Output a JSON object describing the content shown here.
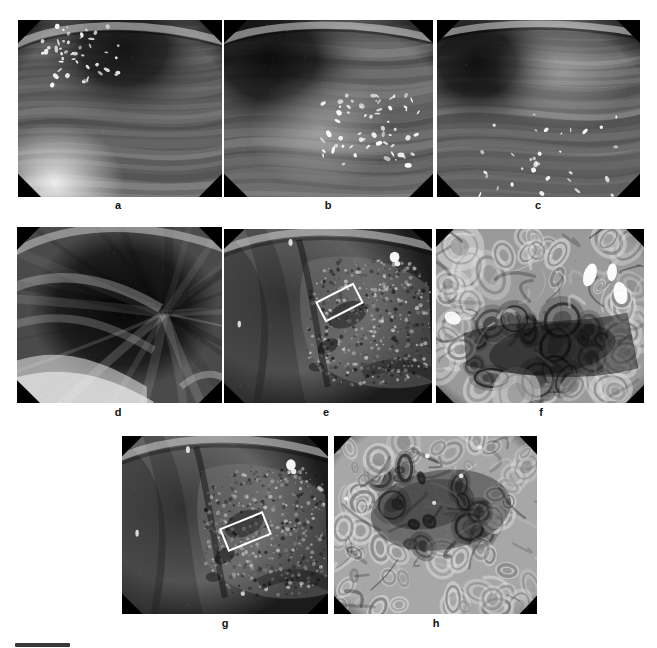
{
  "figure": {
    "type": "multi-panel-endoscopy-figure",
    "background_color": "#ffffff",
    "width": 657,
    "height": 648,
    "panel_count": 8,
    "rows": 3,
    "caption_bar": {
      "present": true,
      "color": "#3a3a3a"
    }
  },
  "panels": [
    {
      "id": "a",
      "label": "a",
      "modality": "white-light endoscopy",
      "description": "Endoscopic view of gastric mucosa with mucus bubbles in upper left; dark lumen at top center; bright reflection along lower left",
      "x": 18,
      "y": 20,
      "w": 204,
      "h": 177,
      "label_x": 103,
      "label_y": 199,
      "frame_color": "#000000",
      "tone": {
        "base": "#6a6a6a",
        "dark": "#141414",
        "bright": "#f2f2f2"
      }
    },
    {
      "id": "b",
      "label": "b",
      "modality": "white-light endoscopy",
      "description": "Gastric mucosa with dark lumen upper left and a cluster of bright specular highlights on right half",
      "x": 224,
      "y": 20,
      "w": 209,
      "h": 177,
      "label_x": 313,
      "label_y": 199,
      "frame_color": "#000000",
      "tone": {
        "base": "#6e6e6e",
        "dark": "#0d0d0d",
        "bright": "#ffffff"
      }
    },
    {
      "id": "c",
      "label": "c",
      "modality": "white-light endoscopy",
      "description": "Gastric mucosa, dark lumen at upper left, fine bright mucus streaks at lower edge and right",
      "x": 437,
      "y": 20,
      "w": 203,
      "h": 177,
      "label_x": 523,
      "label_y": 199,
      "frame_color": "#000000",
      "tone": {
        "base": "#6b6b6b",
        "dark": "#101010",
        "bright": "#fbfbfb"
      }
    },
    {
      "id": "d",
      "label": "d",
      "modality": "white-light endoscopy",
      "description": "Dark retroflexed view of gastric folds radiating from a dark central lumen, bright fold crest along bottom",
      "x": 17,
      "y": 227,
      "w": 205,
      "h": 176,
      "label_x": 103,
      "label_y": 406,
      "frame_color": "#000000",
      "tone": {
        "base": "#4a4a4a",
        "dark": "#0a0a0a",
        "bright": "#ededed"
      }
    },
    {
      "id": "e",
      "label": "e",
      "modality": "chromoendoscopy / indigo carmine",
      "description": "Mucosal lesion with irregular surface on right; white rectangle marks the magnified region",
      "x": 224,
      "y": 229,
      "w": 208,
      "h": 174,
      "label_x": 311,
      "label_y": 406,
      "frame_color": "#000000",
      "tone": {
        "base": "#5f5f5f",
        "dark": "#121212",
        "bright": "#ffffff"
      },
      "annotation": {
        "type": "rectangle",
        "color": "#ffffff",
        "stroke_width": 2,
        "x": 318,
        "y": 291,
        "w": 43,
        "h": 23,
        "rotation_deg": -27
      }
    },
    {
      "id": "f",
      "label": "f",
      "modality": "magnifying endoscopy",
      "description": "High magnification view of gyrus-like / cerebriform pit pattern with bright reflections upper right and left",
      "x": 436,
      "y": 229,
      "w": 208,
      "h": 174,
      "label_x": 526,
      "label_y": 406,
      "frame_color": "#000000",
      "tone": {
        "base": "#9a9a9a",
        "dark": "#1a1a1a",
        "bright": "#ffffff"
      }
    },
    {
      "id": "g",
      "label": "g",
      "modality": "chromoendoscopy / indigo carmine",
      "description": "Same lesion as panel e after staining; white rectangle marks the magnified region shown in panel h",
      "x": 122,
      "y": 436,
      "w": 206,
      "h": 178,
      "label_x": 210,
      "label_y": 617,
      "frame_color": "#000000",
      "tone": {
        "base": "#636363",
        "dark": "#121212",
        "bright": "#ffffff"
      },
      "annotation": {
        "type": "rectangle",
        "color": "#ffffff",
        "stroke_width": 2,
        "x": 222,
        "y": 519,
        "w": 47,
        "h": 25,
        "rotation_deg": -22
      }
    },
    {
      "id": "h",
      "label": "h",
      "modality": "magnifying endoscopy",
      "description": "High magnification view of irregular villous / pit pattern with a darker disrupted central zone",
      "x": 334,
      "y": 436,
      "w": 203,
      "h": 178,
      "label_x": 421,
      "label_y": 617,
      "frame_color": "#000000",
      "tone": {
        "base": "#a7a7a7",
        "dark": "#2a2a2a",
        "bright": "#ffffff"
      }
    }
  ],
  "scalebar": {
    "x": 15,
    "y": 643,
    "w": 55,
    "h": 4,
    "color": "#3a3a3a"
  }
}
